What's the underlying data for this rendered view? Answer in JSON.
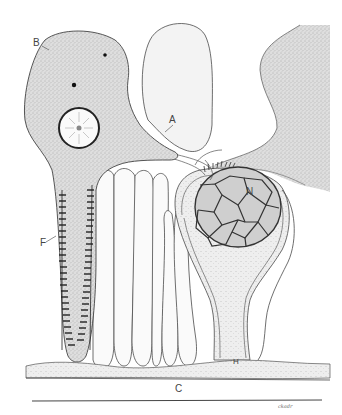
{
  "figure": {
    "type": "biological illustration",
    "labels": [
      {
        "id": "A",
        "text": "A",
        "x": 171,
        "y": 122
      },
      {
        "id": "B",
        "text": "B",
        "x": 33,
        "y": 42
      },
      {
        "id": "F",
        "text": "F",
        "x": 40,
        "y": 240
      },
      {
        "id": "N",
        "text": "N",
        "x": 247,
        "y": 189
      },
      {
        "id": "H",
        "text": "H",
        "x": 233,
        "y": 362
      },
      {
        "id": "C",
        "text": "C",
        "x": 175,
        "y": 386
      }
    ],
    "signature": "ckadr"
  },
  "colors": {
    "ink": "#3a3a3a",
    "stipple_fill": "#d4d4d4",
    "light_fill": "#f1f1f1",
    "nucleus_fill": "#c9c9c9",
    "background": "#ffffff"
  }
}
